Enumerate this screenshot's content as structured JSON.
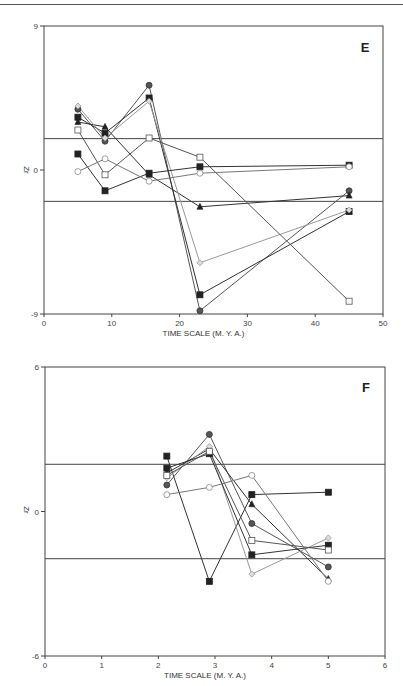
{
  "page": {
    "page_mark": ""
  },
  "chart_data": [
    {
      "panel": "E",
      "type": "line",
      "title": "E",
      "xlabel": "TIME SCALE (M. Y. A.)",
      "ylabel": "Zr",
      "xlim": [
        0,
        50
      ],
      "ylim": [
        -9,
        9
      ],
      "xticks": [
        0,
        10,
        20,
        30,
        40,
        50
      ],
      "yticks": [
        -9,
        0,
        9
      ],
      "reference_lines": [
        1.96,
        -1.96
      ],
      "grid": false,
      "legend": null,
      "x": [
        5,
        9,
        15.5,
        23,
        45
      ],
      "series": [
        {
          "name": "filled-circle",
          "marker": "circle-filled",
          "values": [
            3.8,
            1.8,
            5.3,
            -8.8,
            -1.3
          ],
          "color": "#555555"
        },
        {
          "name": "filled-square-a",
          "marker": "square-filled",
          "values": [
            3.3,
            2.3,
            4.5,
            -7.8,
            -2.6
          ],
          "color": "#333333"
        },
        {
          "name": "filled-triangle",
          "marker": "triangle-filled",
          "values": [
            3.0,
            2.7,
            -0.3,
            -2.3,
            -1.6
          ],
          "color": "#333333"
        },
        {
          "name": "open-diamond",
          "marker": "diamond-open",
          "values": [
            4.0,
            2.0,
            4.3,
            -5.8,
            -2.5
          ],
          "color": "#999999"
        },
        {
          "name": "open-square",
          "marker": "square-open",
          "values": [
            2.5,
            -0.3,
            2.0,
            0.8,
            -8.2
          ],
          "color": "#555555"
        },
        {
          "name": "filled-square-b",
          "marker": "square-filled",
          "values": [
            1.0,
            -1.3,
            -0.2,
            0.2,
            0.3
          ],
          "color": "#333333"
        },
        {
          "name": "open-circle",
          "marker": "circle-open",
          "values": [
            -0.1,
            0.7,
            -0.7,
            -0.2,
            0.2
          ],
          "color": "#777777"
        }
      ]
    },
    {
      "panel": "F",
      "type": "line",
      "title": "F",
      "xlabel": "TIME SCALE (M. Y. A.)",
      "ylabel": "Zr",
      "xlim": [
        0,
        6
      ],
      "ylim": [
        -6,
        6
      ],
      "xticks": [
        0,
        1,
        2,
        3,
        4,
        5,
        6
      ],
      "yticks": [
        -6,
        0,
        6
      ],
      "reference_lines": [
        1.96,
        -1.96
      ],
      "grid": false,
      "legend": null,
      "x": [
        2.15,
        2.9,
        3.65,
        5.0
      ],
      "series": [
        {
          "name": "filled-square-a",
          "marker": "square-filled",
          "values": [
            2.3,
            -2.9,
            0.7,
            0.8
          ],
          "color": "#333333"
        },
        {
          "name": "filled-circle",
          "marker": "circle-filled",
          "values": [
            1.1,
            3.2,
            -0.5,
            -2.3
          ],
          "color": "#555555"
        },
        {
          "name": "filled-triangle",
          "marker": "triangle-filled",
          "values": [
            1.6,
            2.6,
            0.3,
            -2.8
          ],
          "color": "#333333"
        },
        {
          "name": "open-diamond",
          "marker": "diamond-open",
          "values": [
            1.4,
            2.7,
            -2.6,
            -1.1
          ],
          "color": "#999999"
        },
        {
          "name": "filled-square-b",
          "marker": "square-filled",
          "values": [
            1.8,
            2.4,
            -1.8,
            -1.4
          ],
          "color": "#333333"
        },
        {
          "name": "open-square",
          "marker": "square-open",
          "values": [
            1.5,
            2.5,
            -1.2,
            -1.6
          ],
          "color": "#555555"
        },
        {
          "name": "open-circle",
          "marker": "circle-open",
          "values": [
            0.7,
            1.0,
            1.5,
            -2.9
          ],
          "color": "#777777"
        }
      ]
    }
  ]
}
